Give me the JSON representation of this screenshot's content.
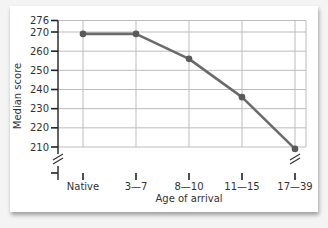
{
  "chart_data": {
    "type": "line",
    "title": "",
    "xlabel": "Age of arrival",
    "ylabel": "Median score",
    "categories": [
      "Native",
      "3—7",
      "8—10",
      "11—15",
      "17—39"
    ],
    "series": [
      {
        "name": "Median score",
        "values": [
          269,
          269,
          256,
          236,
          209
        ]
      }
    ],
    "ylim": [
      210,
      276
    ],
    "yticks": [
      276,
      270,
      260,
      250,
      240,
      230,
      220,
      210
    ],
    "axis_break": true,
    "grid": true,
    "legend": "none",
    "line_color": "#6b6b6b",
    "grid_color": "#bdbdbd"
  }
}
